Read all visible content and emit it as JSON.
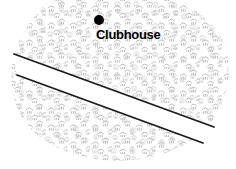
{
  "figure": {
    "type": "map",
    "kind": "golf-course-sketch-map",
    "background_color": "#ffffff",
    "width": 236,
    "height": 169
  },
  "terrain": {
    "name": "rough-vegetation-area",
    "symbol_name": "scrub-tuft-icon",
    "symbol_color": "#b4b4b4",
    "fill_color": "#ffffff",
    "description": "scattered small arc tufts"
  },
  "corridor": {
    "name": "fairway-corridor",
    "fill_color": "#ffffff",
    "edge_color": "#1a1a1a",
    "edge_width": 1.8,
    "upper_edge": {
      "x1": 14,
      "y1": 54,
      "x2": 214,
      "y2": 127
    },
    "lower_edge": {
      "x1": 17,
      "y1": 75,
      "x2": 203,
      "y2": 143
    }
  },
  "markers": [
    {
      "name": "clubhouse-marker",
      "label": "Clubhouse",
      "dot_color": "#000000",
      "dot_x": 99,
      "dot_y": 20,
      "dot_r": 5,
      "label_x": 96,
      "label_y": 39
    }
  ]
}
